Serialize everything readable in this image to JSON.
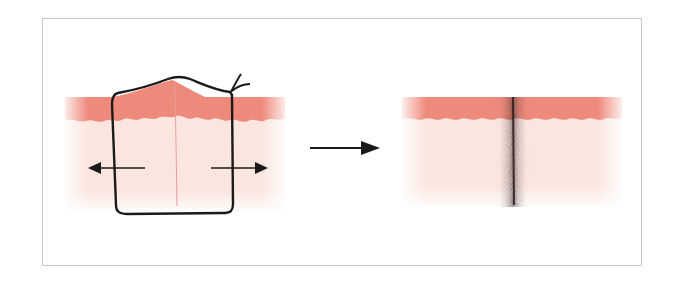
{
  "figure": {
    "colors": {
      "epidermis": "#ee8a7c",
      "dermis": "#fbe6df",
      "suture": "#1a1a1a",
      "incision": "#e89a9a",
      "scar": "#2a1c1c",
      "frame_border": "#c8c8c8"
    },
    "panels": [
      {
        "name": "sutured-wound",
        "label": ""
      },
      {
        "name": "healed-scar",
        "label": ""
      }
    ],
    "arrows": [
      {
        "name": "tension-left",
        "direction": "left"
      },
      {
        "name": "tension-right",
        "direction": "right"
      },
      {
        "name": "transition",
        "direction": "right"
      }
    ]
  }
}
